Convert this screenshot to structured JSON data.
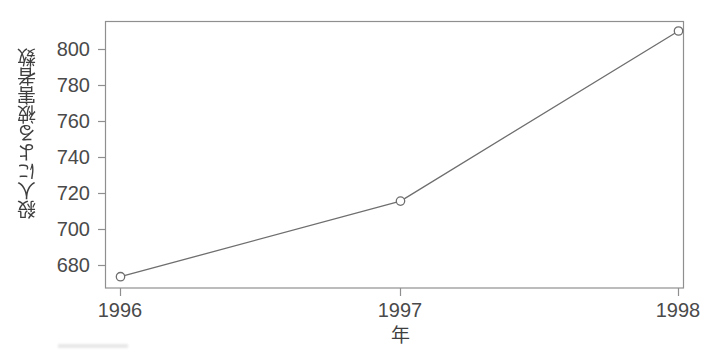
{
  "chart_data": {
    "type": "line",
    "title": "",
    "subtitle": "",
    "xlabel": "年",
    "ylabel": "殺人による被害者数",
    "x": [
      1996,
      1997,
      1998
    ],
    "categories": [
      "1996",
      "1997",
      "1998"
    ],
    "values": [
      680,
      720,
      810
    ],
    "series": [
      {
        "name": "殺人による被害者数",
        "values": [
          680,
          720,
          810
        ]
      }
    ],
    "xtick_labels": [
      "1996",
      "1997",
      "1998"
    ],
    "ytick_labels": [
      "680",
      "700",
      "720",
      "740",
      "760",
      "780",
      "800"
    ],
    "ytick_values": [
      680,
      700,
      720,
      740,
      760,
      780,
      800
    ],
    "ylim": [
      674,
      815
    ],
    "xlim": [
      1995.85,
      1998.1
    ],
    "grid": false,
    "legend": false,
    "legend_position": "none",
    "marker": "open-circle",
    "line_color": "#6e6e6e",
    "marker_color": "#6e6e6e",
    "axis_color": "#8a8a8a",
    "text_color": "#4a4a4a",
    "background_color": "#ffffff",
    "annotations": []
  }
}
